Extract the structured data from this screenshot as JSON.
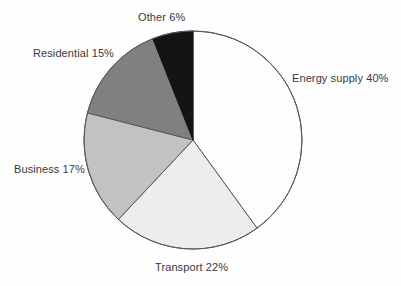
{
  "chart_data": {
    "type": "pie",
    "title": "",
    "subtitle": "",
    "xlabel": "",
    "ylabel": "",
    "legend_position": "none",
    "grid": false,
    "labels_outside": true,
    "start_angle_deg": 0,
    "direction": "clockwise",
    "categories": [
      "Energy supply",
      "Transport",
      "Business",
      "Residential",
      "Other"
    ],
    "values": [
      40,
      22,
      17,
      15,
      6
    ],
    "unit": "%",
    "slices": [
      {
        "name": "Energy supply",
        "value": 40,
        "label": "Energy supply 40%",
        "color": "#fdfdfd",
        "stroke": "#595959",
        "start_deg": 0,
        "end_deg": 144
      },
      {
        "name": "Transport",
        "value": 22,
        "label": "Transport 22%",
        "color": "#ededed",
        "stroke": "#595959",
        "start_deg": 144,
        "end_deg": 223.2
      },
      {
        "name": "Business",
        "value": 17,
        "label": "Business 17%",
        "color": "#c2c2c2",
        "stroke": "#595959",
        "start_deg": 223.2,
        "end_deg": 284.4
      },
      {
        "name": "Residential",
        "value": 15,
        "label": "Residential 15%",
        "color": "#808080",
        "stroke": "#595959",
        "start_deg": 284.4,
        "end_deg": 338.4
      },
      {
        "name": "Other",
        "value": 6,
        "label": "Other 6%",
        "color": "#141414",
        "stroke": "#141414",
        "start_deg": 338.4,
        "end_deg": 360
      }
    ],
    "geometry": {
      "center_x": 193,
      "center_y": 140,
      "radius": 109
    },
    "colors": {
      "background": "#fefefe",
      "outline": "#595959",
      "text": "#3a3a3a"
    }
  },
  "labels": {
    "energy_supply": "Energy supply 40%",
    "transport": "Transport 22%",
    "business": "Business 17%",
    "residential": "Residential 15%",
    "other": "Other 6%"
  }
}
